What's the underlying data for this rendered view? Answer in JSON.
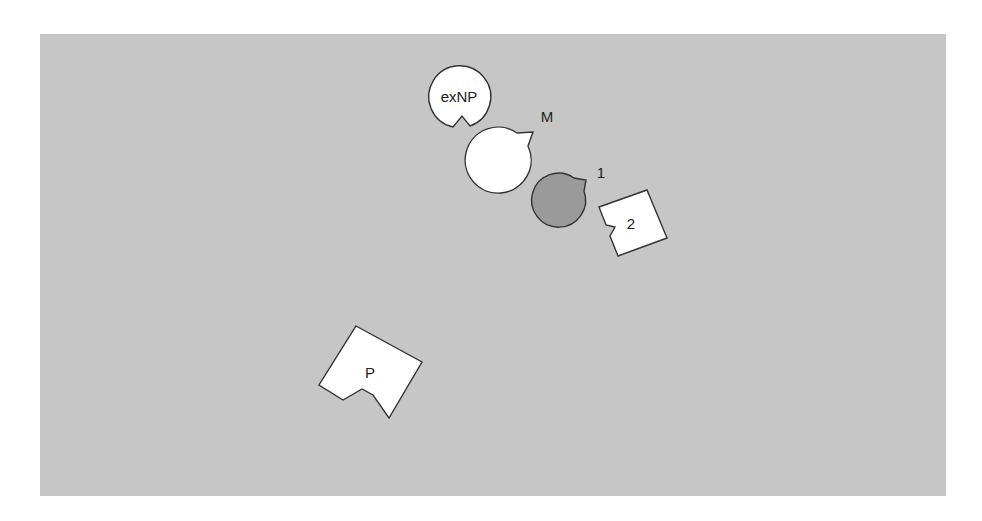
{
  "diagram": {
    "background_color": "#c6c6c6",
    "nodes": [
      {
        "id": "exNP",
        "label": "exNP",
        "shape": "circle-notched",
        "fill": "#ffffff"
      },
      {
        "id": "M",
        "label": "M",
        "shape": "circle-notched",
        "fill": "#ffffff"
      },
      {
        "id": "1",
        "label": "1",
        "shape": "circle-notched",
        "fill": "#9a9a9a"
      },
      {
        "id": "2",
        "label": "2",
        "shape": "square-notched",
        "fill": "#ffffff"
      },
      {
        "id": "P",
        "label": "P",
        "shape": "square-notched",
        "fill": "#ffffff"
      }
    ]
  }
}
